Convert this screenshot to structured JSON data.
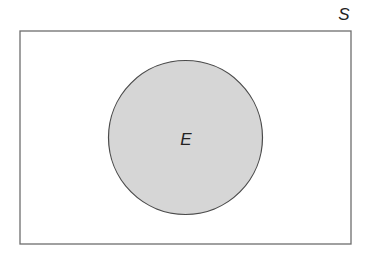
{
  "diagram": {
    "type": "venn",
    "sample_space": {
      "label": "S",
      "x": 20,
      "y": 31,
      "width": 331,
      "height": 213,
      "stroke": "#6e6e6e",
      "fill": "#ffffff"
    },
    "event": {
      "label": "E",
      "cx": 185.5,
      "cy": 137.5,
      "r": 77,
      "stroke": "#4a4a4a",
      "fill": "#d6d6d6"
    }
  }
}
